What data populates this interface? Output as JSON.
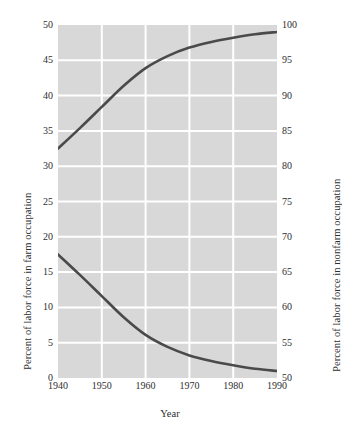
{
  "chart_data": {
    "type": "line",
    "title": "",
    "xlabel": "Year",
    "ylabel": "Percent of labor force in farm occupation",
    "ylabel_right": "Percent of labor force in nonfarm occupation",
    "xlim": [
      1940,
      1990
    ],
    "ylim": [
      0,
      50
    ],
    "ylim_right": [
      50,
      100
    ],
    "xticks": [
      1940,
      1950,
      1960,
      1970,
      1980,
      1990
    ],
    "xticklabels": [
      "1940",
      "1950",
      "1960",
      "1970",
      "1980",
      "1990"
    ],
    "yticks": [
      0,
      5,
      10,
      15,
      20,
      25,
      30,
      35,
      40,
      45,
      50
    ],
    "yticklabels": [
      "0",
      "5",
      "10",
      "15",
      "20",
      "25",
      "30",
      "35",
      "40",
      "45",
      "50"
    ],
    "yticks_right": [
      50,
      55,
      60,
      65,
      70,
      75,
      80,
      85,
      90,
      95,
      100
    ],
    "yticklabels_right": [
      "50",
      "55",
      "60",
      "65",
      "70",
      "75",
      "80",
      "85",
      "90",
      "95",
      "100"
    ],
    "grid": true,
    "grid_color": "#ffffff",
    "plot_background": "#d8d8d8",
    "legend": "none",
    "line_color": "#4a4a4a",
    "x": [
      1940,
      1945,
      1950,
      1955,
      1960,
      1965,
      1970,
      1975,
      1980,
      1985,
      1990
    ],
    "series": [
      {
        "name": "Percent of labor force in farm occupation",
        "axis": "left",
        "values": [
          17.5,
          14.6,
          11.6,
          8.6,
          6.1,
          4.4,
          3.2,
          2.4,
          1.8,
          1.3,
          1.0
        ]
      },
      {
        "name": "Percent of labor force in nonfarm occupation",
        "axis": "right",
        "values": [
          82.5,
          85.4,
          88.4,
          91.4,
          93.9,
          95.6,
          96.8,
          97.6,
          98.2,
          98.7,
          99.0
        ]
      }
    ]
  },
  "axes": {
    "left_title": "Percent of labor force in farm occupation",
    "right_title": "Percent of labor force in nonfarm occupation",
    "x_title": "Year"
  }
}
